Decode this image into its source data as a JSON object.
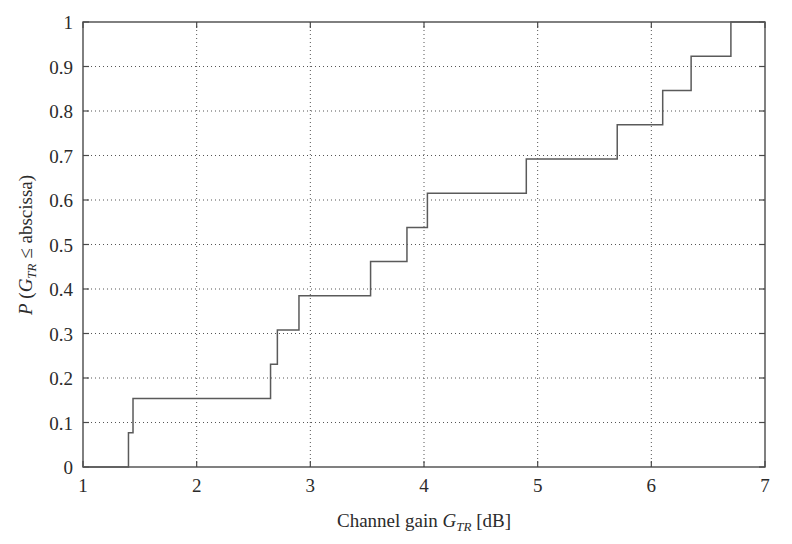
{
  "figure": {
    "background_color": "#ffffff",
    "axis_color": "#4a4a4a",
    "grid_color": "#555555",
    "line_color": "#5a5a5a"
  },
  "axes": {
    "x_title_parts": {
      "prefix": "Channel gain ",
      "symbol": "G",
      "subscript": "TR",
      "suffix": " [dB]"
    },
    "y_title_parts": {
      "prefix": "P",
      "open": " (",
      "symbol": "G",
      "subscript": "TR",
      "relation": " ≤ abscissa)"
    },
    "x_ticks": [
      "1",
      "2",
      "3",
      "4",
      "5",
      "6",
      "7"
    ],
    "y_ticks": [
      "0",
      "0.1",
      "0.2",
      "0.3",
      "0.4",
      "0.5",
      "0.6",
      "0.7",
      "0.8",
      "0.9",
      "1"
    ]
  },
  "chart_data": {
    "type": "line",
    "title": "",
    "xlabel": "Channel gain G_TR [dB]",
    "ylabel": "P (G_TR ≤ abscissa)",
    "xlim": [
      1,
      7
    ],
    "ylim": [
      0,
      1
    ],
    "grid": true,
    "legend": "none",
    "step_style": "post",
    "series": [
      {
        "name": "Empirical CDF of channel gain",
        "x": [
          1.0,
          1.4,
          1.4,
          1.44,
          1.44,
          2.65,
          2.65,
          2.71,
          2.71,
          2.9,
          2.9,
          3.53,
          3.53,
          3.85,
          3.85,
          4.03,
          4.03,
          4.9,
          4.9,
          5.7,
          5.7,
          6.1,
          6.1,
          6.35,
          6.35,
          6.7,
          6.7,
          7.0
        ],
        "y": [
          0.0,
          0.0,
          0.077,
          0.077,
          0.154,
          0.154,
          0.231,
          0.231,
          0.308,
          0.308,
          0.385,
          0.385,
          0.462,
          0.462,
          0.538,
          0.538,
          0.615,
          0.615,
          0.692,
          0.692,
          0.769,
          0.769,
          0.846,
          0.846,
          0.923,
          0.923,
          1.0,
          1.0
        ]
      }
    ],
    "jump_points": [
      {
        "x": 1.4,
        "cdf": 0.077
      },
      {
        "x": 1.44,
        "cdf": 0.154
      },
      {
        "x": 2.65,
        "cdf": 0.231
      },
      {
        "x": 2.71,
        "cdf": 0.308
      },
      {
        "x": 2.9,
        "cdf": 0.385
      },
      {
        "x": 3.53,
        "cdf": 0.462
      },
      {
        "x": 3.85,
        "cdf": 0.538
      },
      {
        "x": 4.03,
        "cdf": 0.615
      },
      {
        "x": 4.9,
        "cdf": 0.692
      },
      {
        "x": 5.7,
        "cdf": 0.769
      },
      {
        "x": 6.1,
        "cdf": 0.846
      },
      {
        "x": 6.35,
        "cdf": 0.923
      },
      {
        "x": 6.7,
        "cdf": 1.0
      }
    ],
    "xticks": [
      1,
      2,
      3,
      4,
      5,
      6,
      7
    ],
    "yticks": [
      0,
      0.1,
      0.2,
      0.3,
      0.4,
      0.5,
      0.6,
      0.7,
      0.8,
      0.9,
      1
    ]
  }
}
